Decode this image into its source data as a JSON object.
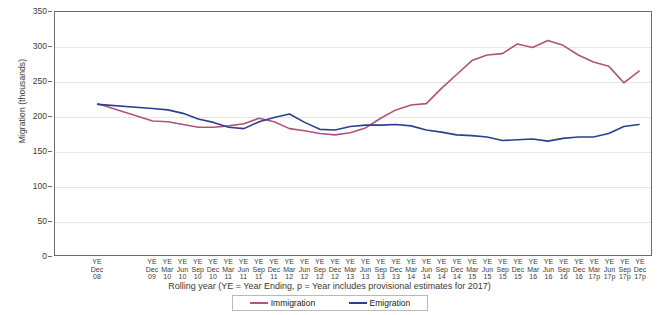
{
  "chart_data": {
    "type": "line",
    "title": "",
    "xlabel": "Rolling year (YE = Year Ending, p = Year includes provisional  estimates for  2017)",
    "ylabel": "Migration (thousands)",
    "ylim": [
      0,
      350
    ],
    "ytick_values": [
      0,
      50,
      100,
      150,
      200,
      250,
      300,
      350
    ],
    "grid": true,
    "legend_position": "bottom",
    "categories": [
      "YE Dec 08",
      "YE Dec 09",
      "YE Mar 10",
      "YE Jun 10",
      "YE Sep 10",
      "YE Dec 10",
      "YE Mar 11",
      "YE Jun 11",
      "YE Sep 11",
      "YE Dec 11",
      "YE Mar 12",
      "YE Jun 12",
      "YE Sep 12",
      "YE Dec 12",
      "YE Mar 13",
      "YE Jun 13",
      "YE Sep 13",
      "YE Dec 13",
      "YE Mar 14",
      "YE Jun 14",
      "YE Sep 14",
      "YE Dec 14",
      "YE Mar 15",
      "YE Jun 15",
      "YE Sep 15",
      "YE Dec 15",
      "YE Mar 16",
      "YE Jun 16",
      "YE Sep 16",
      "YE Dec 16",
      "YE Mar 17p",
      "YE Jun 17p",
      "YE Sep 17p",
      "YE Dec 17p"
    ],
    "category_lines": [
      [
        "YE",
        "Dec",
        "08"
      ],
      [
        "YE",
        "Dec",
        "09"
      ],
      [
        "YE",
        "Mar",
        "10"
      ],
      [
        "YE",
        "Jun",
        "10"
      ],
      [
        "YE",
        "Sep",
        "10"
      ],
      [
        "YE",
        "Dec",
        "10"
      ],
      [
        "YE",
        "Mar",
        "11"
      ],
      [
        "YE",
        "Jun",
        "11"
      ],
      [
        "YE",
        "Sep",
        "11"
      ],
      [
        "YE",
        "Dec",
        "11"
      ],
      [
        "YE",
        "Mar",
        "12"
      ],
      [
        "YE",
        "Jun",
        "12"
      ],
      [
        "YE",
        "Sep",
        "12"
      ],
      [
        "YE",
        "Dec",
        "12"
      ],
      [
        "YE",
        "Mar",
        "13"
      ],
      [
        "YE",
        "Jun",
        "13"
      ],
      [
        "YE",
        "Sep",
        "13"
      ],
      [
        "YE",
        "Dec",
        "13"
      ],
      [
        "YE",
        "Mar",
        "14"
      ],
      [
        "YE",
        "Jun",
        "14"
      ],
      [
        "YE",
        "Sep",
        "14"
      ],
      [
        "YE",
        "Dec",
        "14"
      ],
      [
        "YE",
        "Mar",
        "15"
      ],
      [
        "YE",
        "Jun",
        "15"
      ],
      [
        "YE",
        "Sep",
        "15"
      ],
      [
        "YE",
        "Dec",
        "15"
      ],
      [
        "YE",
        "Mar",
        "16"
      ],
      [
        "YE",
        "Jun",
        "16"
      ],
      [
        "YE",
        "Sep",
        "16"
      ],
      [
        "YE",
        "Dec",
        "16"
      ],
      [
        "YE",
        "Mar",
        "17p"
      ],
      [
        "YE",
        "Jun",
        "17p"
      ],
      [
        "YE",
        "Sep",
        "17p"
      ],
      [
        "YE",
        "Dec",
        "17p"
      ]
    ],
    "series": [
      {
        "name": "Immigration",
        "color": "#b2527d",
        "values": [
          218,
          193,
          192,
          188,
          184,
          184,
          186,
          189,
          197,
          192,
          182,
          179,
          175,
          173,
          176,
          183,
          197,
          209,
          216,
          218,
          240,
          260,
          280,
          288,
          290,
          304,
          299,
          309,
          302,
          288,
          278,
          272,
          248,
          265
        ]
      },
      {
        "name": "Emigration",
        "color": "#2f3f8f",
        "values": [
          217,
          211,
          209,
          204,
          196,
          191,
          184,
          182,
          192,
          198,
          203,
          191,
          181,
          180,
          185,
          187,
          187,
          188,
          186,
          180,
          177,
          173,
          172,
          170,
          165,
          166,
          167,
          164,
          168,
          170,
          170,
          175,
          185,
          188
        ]
      }
    ]
  },
  "legend": {
    "items": [
      {
        "label": "Immigration",
        "color": "#b2527d"
      },
      {
        "label": "Emigration",
        "color": "#2f3f8f"
      }
    ]
  }
}
